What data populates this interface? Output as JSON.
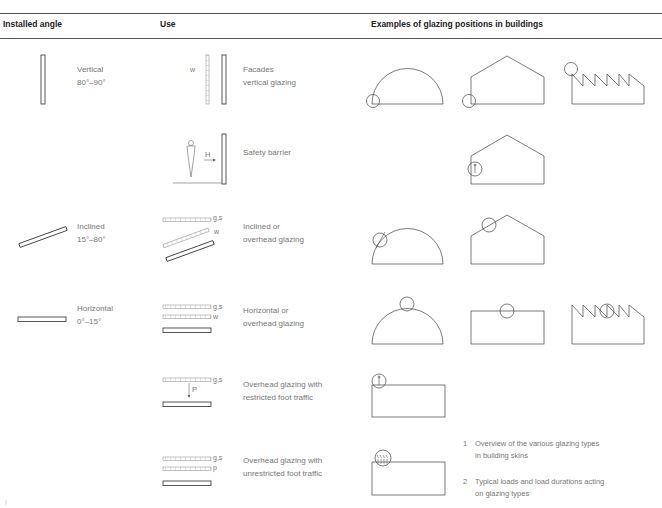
{
  "header": {
    "col_angle": "Installed angle",
    "col_use": "Use",
    "col_examples": "Examples of glazing positions in buildings"
  },
  "angles": [
    {
      "name": "Vertical",
      "range": "80°–90°"
    },
    {
      "name": "Inclined",
      "range": "15°–80°"
    },
    {
      "name": "Horizontal",
      "range": "0°–15°"
    }
  ],
  "uses": [
    {
      "line1": "Facades",
      "line2": "vertical glazing",
      "loads": [
        "w"
      ]
    },
    {
      "line1": "Safety barrier",
      "line2": "",
      "loads": [
        "H"
      ]
    },
    {
      "line1": "Inclined or",
      "line2": "overhead glazing",
      "loads": [
        "g,s",
        "w"
      ]
    },
    {
      "line1": "Horizontal or",
      "line2": "overhead glazing",
      "loads": [
        "g,s",
        "w"
      ]
    },
    {
      "line1": "Overhead glazing with",
      "line2": "restricted foot traffic",
      "loads": [
        "g,s",
        "P"
      ]
    },
    {
      "line1": "Overhead glazing with",
      "line2": "unrestricted foot traffic",
      "loads": [
        "g,s",
        "p"
      ]
    }
  ],
  "captions": [
    {
      "num": "1",
      "line1": "Overview of the various glazing types",
      "line2": "in building skins"
    },
    {
      "num": "2",
      "line1": "Typical loads and load durations acting",
      "line2": "on glazing types"
    }
  ],
  "colors": {
    "line": "#555555",
    "text": "#777777",
    "header": "#222222"
  }
}
